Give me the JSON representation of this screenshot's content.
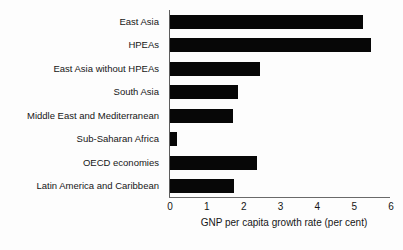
{
  "chart_data": {
    "type": "bar",
    "orientation": "horizontal",
    "title": "",
    "xlabel": "GNP per capita growth rate (per cent)",
    "ylabel": "",
    "xlim": [
      0,
      6
    ],
    "xticks": [
      "0",
      "1",
      "2",
      "3",
      "4",
      "5",
      "6"
    ],
    "grid": false,
    "legend": false,
    "bar_color": "#070707",
    "categories": [
      "East Asia",
      "HPEAs",
      "East Asia without HPEAs",
      "South Asia",
      "Middle East and Mediterranean",
      "Sub-Saharan Africa",
      "OECD economies",
      "Latin America and Caribbean"
    ],
    "values": [
      5.25,
      5.45,
      2.45,
      1.85,
      1.7,
      0.2,
      2.35,
      1.75
    ]
  }
}
